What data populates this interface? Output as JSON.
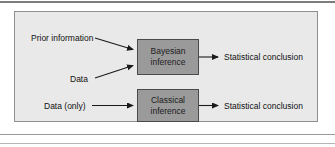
{
  "figure": {
    "type": "flow-diagram",
    "panel": {
      "background_color": "#e9e9e9",
      "border_color": "#8f8f8f"
    },
    "box_fill_color": "#9a9a9a",
    "box_border_color": "#4a4a4a",
    "text_color": "#111111",
    "nodes": [
      {
        "id": "bayesian",
        "line1": "Bayesian",
        "line2": "inference"
      },
      {
        "id": "classical",
        "line1": "Classical",
        "line2": "inference"
      }
    ],
    "inputs": [
      {
        "id": "prior",
        "label": "Prior information",
        "target": "bayesian"
      },
      {
        "id": "data",
        "label": "Data",
        "target": "bayesian"
      },
      {
        "id": "data-only",
        "label": "Data (only)",
        "target": "classical"
      }
    ],
    "outputs": [
      {
        "id": "conclusion-bayesian",
        "label": "Statistical conclusion",
        "source": "bayesian"
      },
      {
        "id": "conclusion-classical",
        "label": "Statistical conclusion",
        "source": "classical"
      }
    ]
  }
}
